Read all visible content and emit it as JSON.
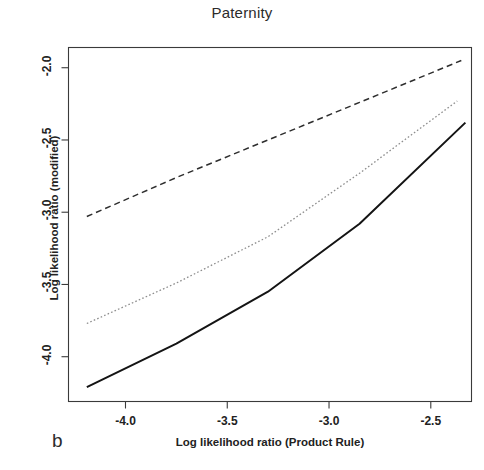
{
  "figure": {
    "panel_label": "b",
    "title": "Paternity"
  },
  "chart_data": {
    "type": "line",
    "title": "Paternity",
    "xlabel": "Log likelihood ratio (Product Rule)",
    "ylabel": "Log likelihood ratio (modified)",
    "xlim": [
      -4.28,
      -2.3
    ],
    "ylim": [
      -4.31,
      -1.86
    ],
    "xticks": [
      -4.0,
      -3.5,
      -3.0,
      -2.5
    ],
    "xtick_labels": [
      "-4.0",
      "-3.5",
      "-3.0",
      "-2.5"
    ],
    "yticks": [
      -2.0,
      -2.5,
      -3.0,
      -3.5,
      -4.0
    ],
    "ytick_labels": [
      "-2.0",
      "-2.5",
      "-3.0",
      "-3.5",
      "-4.0"
    ],
    "grid": false,
    "legend": "none",
    "series": [
      {
        "name": "upper-dashed",
        "style": "dashed",
        "color": "#2e2e2e",
        "x": [
          -4.19,
          -3.75,
          -3.3,
          -2.85,
          -2.35
        ],
        "y": [
          -3.03,
          -2.76,
          -2.5,
          -2.24,
          -1.95
        ]
      },
      {
        "name": "middle-dotted",
        "style": "dotted",
        "color": "#8e8e8e",
        "x": [
          -4.19,
          -3.75,
          -3.3,
          -2.85,
          -2.37
        ],
        "y": [
          -3.77,
          -3.49,
          -3.17,
          -2.73,
          -2.23
        ]
      },
      {
        "name": "lower-solid",
        "style": "solid",
        "color": "#141414",
        "x": [
          -4.19,
          -3.75,
          -3.3,
          -2.85,
          -2.33
        ],
        "y": [
          -4.21,
          -3.91,
          -3.55,
          -3.08,
          -2.38
        ]
      }
    ]
  }
}
